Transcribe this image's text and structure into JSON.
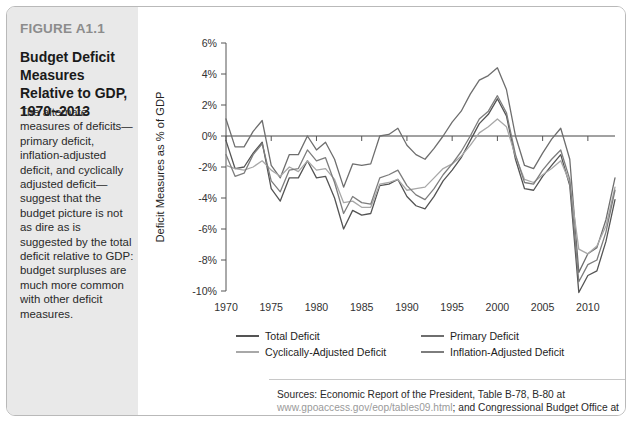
{
  "figure": {
    "label": "FIGURE A1.1",
    "title": "Budget Deficit Measures Relative to GDP, 1970–2013",
    "caption": "The alternate measures of deficits—primary deficit, inflation-adjusted deficit, and cyclically adjusted deficit—suggest that the budget picture is not as dire as is suggested by the total deficit relative to GDP: budget surpluses are much more common with other deficit measures."
  },
  "sources": {
    "prefix": "Sources: Economic Report of the President, Table B-78, B-80 at ",
    "url1": "www.gpoaccess.gov/eop/tables09.html",
    "middle": "; and Congressional Budget Office at ",
    "url2": "www.cbo.gov/publications/bysubject.cfm?cat=32"
  },
  "colors": {
    "total_deficit": "#545454",
    "primary_deficit": "#6e6e6e",
    "cyclically_adjusted_deficit": "#a8a8a8",
    "inflation_adjusted_deficit": "#7d7d7d",
    "sidebar_bg": "#e9e9e9",
    "axis": "#555555",
    "label_gray": "#8c8c8c"
  },
  "chart_data": {
    "type": "line",
    "title": "Budget Deficit Measures Relative to GDP, 1970–2013",
    "xlabel": "",
    "ylabel": "Deficit Measures as % of GDP",
    "xlim": [
      1970,
      2013
    ],
    "ylim": [
      -10,
      6
    ],
    "ytick_labels": [
      "6%",
      "4%",
      "2%",
      "0%",
      "-2%",
      "-4%",
      "-6%",
      "-8%",
      "-10%"
    ],
    "ytick_values": [
      6,
      4,
      2,
      0,
      -2,
      -4,
      -6,
      -8,
      -10
    ],
    "xtick_labels": [
      "1970",
      "1975",
      "1980",
      "1985",
      "1990",
      "1995",
      "2000",
      "2005",
      "2010"
    ],
    "xtick_values": [
      1970,
      1975,
      1980,
      1985,
      1990,
      1995,
      2000,
      2005,
      2010
    ],
    "grid": false,
    "legend_position": "bottom",
    "x": [
      1970,
      1971,
      1972,
      1973,
      1974,
      1975,
      1976,
      1977,
      1978,
      1979,
      1980,
      1981,
      1982,
      1983,
      1984,
      1985,
      1986,
      1987,
      1988,
      1989,
      1990,
      1991,
      1992,
      1993,
      1994,
      1995,
      1996,
      1997,
      1998,
      1999,
      2000,
      2001,
      2002,
      2003,
      2004,
      2005,
      2006,
      2007,
      2008,
      2009,
      2010,
      2011,
      2012,
      2013
    ],
    "series": [
      {
        "name": "Total Deficit",
        "color": "#545454",
        "values": [
          -0.3,
          -2.1,
          -2.0,
          -1.1,
          -0.4,
          -3.4,
          -4.2,
          -2.7,
          -2.7,
          -1.6,
          -2.7,
          -2.6,
          -4.0,
          -6.0,
          -4.8,
          -5.1,
          -5.0,
          -3.2,
          -3.1,
          -2.8,
          -3.9,
          -4.5,
          -4.7,
          -3.9,
          -2.9,
          -2.2,
          -1.4,
          -0.3,
          0.8,
          1.4,
          2.4,
          1.3,
          -1.5,
          -3.4,
          -3.5,
          -2.6,
          -1.9,
          -1.2,
          -3.2,
          -10.1,
          -9.0,
          -8.7,
          -6.8,
          -4.1
        ]
      },
      {
        "name": "Primary Deficit",
        "color": "#6e6e6e",
        "values": [
          1.1,
          -0.7,
          -0.7,
          0.3,
          1.0,
          -1.9,
          -2.7,
          -1.2,
          -1.2,
          0.0,
          -0.9,
          -0.4,
          -1.5,
          -3.3,
          -1.8,
          -1.9,
          -1.8,
          0.0,
          0.1,
          0.5,
          -0.6,
          -1.2,
          -1.5,
          -0.8,
          0.0,
          0.9,
          1.6,
          2.7,
          3.6,
          3.9,
          4.4,
          3.0,
          0.0,
          -1.9,
          -2.1,
          -1.1,
          -0.2,
          0.5,
          -1.5,
          -8.8,
          -7.6,
          -7.2,
          -5.4,
          -2.7
        ]
      },
      {
        "name": "Cyclically-Adjusted Deficit",
        "color": "#a8a8a8",
        "values": [
          -1.9,
          -2.1,
          -2.2,
          -2.0,
          -1.6,
          -2.2,
          -2.6,
          -2.0,
          -2.3,
          -1.6,
          -2.2,
          -2.1,
          -2.8,
          -4.3,
          -4.2,
          -4.6,
          -4.6,
          -3.1,
          -3.0,
          -2.8,
          -3.5,
          -3.4,
          -3.3,
          -2.7,
          -2.1,
          -1.8,
          -1.3,
          -0.6,
          0.2,
          0.6,
          1.1,
          0.6,
          -1.3,
          -2.8,
          -3.0,
          -2.5,
          -2.1,
          -1.6,
          -3.0,
          -7.3,
          -7.6,
          -7.1,
          -5.8,
          -3.3
        ]
      },
      {
        "name": "Inflation-Adjusted Deficit",
        "color": "#7d7d7d",
        "values": [
          -1.2,
          -2.6,
          -2.4,
          -1.2,
          -0.5,
          -2.9,
          -3.6,
          -2.2,
          -2.1,
          -0.9,
          -1.6,
          -1.4,
          -3.0,
          -5.0,
          -3.9,
          -4.3,
          -4.4,
          -2.7,
          -2.5,
          -2.2,
          -3.2,
          -3.8,
          -4.1,
          -3.4,
          -2.5,
          -1.8,
          -1.0,
          0.0,
          1.1,
          1.6,
          2.6,
          1.5,
          -1.2,
          -3.0,
          -3.1,
          -2.2,
          -1.5,
          -0.9,
          -2.8,
          -9.4,
          -8.3,
          -8.0,
          -6.2,
          -3.5
        ]
      }
    ]
  },
  "legend": [
    {
      "label": "Total Deficit",
      "color": "#545454"
    },
    {
      "label": "Primary Deficit",
      "color": "#6e6e6e"
    },
    {
      "label": "Cyclically-Adjusted Deficit",
      "color": "#a8a8a8"
    },
    {
      "label": "Inflation-Adjusted Deficit",
      "color": "#7d7d7d"
    }
  ]
}
